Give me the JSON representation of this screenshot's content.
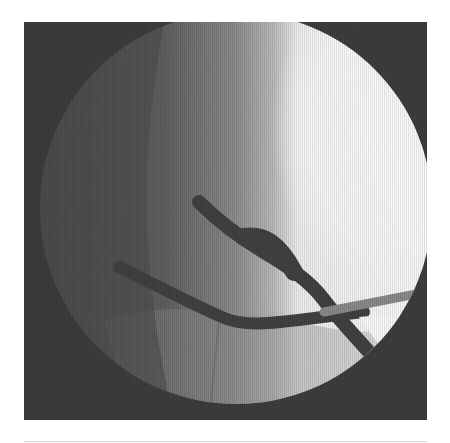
{
  "image": {
    "kind": "fluoroscopy-xray",
    "alt": "Grayscale fluoroscopic image with circular field of view showing crossing dark tubular structures",
    "colors": {
      "frame_background": "#3a3a3a",
      "field_dark": "#4a4a4a",
      "field_mid": "#8e8e8e",
      "field_bright": "#ffffff",
      "vessel": "#3f3f3f",
      "page_background": "#ffffff",
      "rule": "#d6d6d6"
    }
  }
}
